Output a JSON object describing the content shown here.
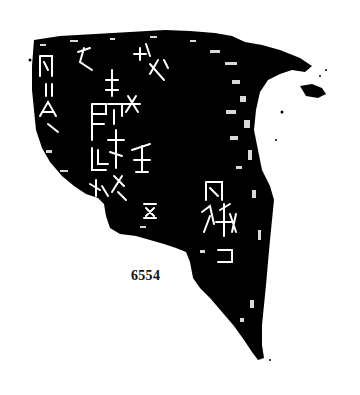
{
  "figure": {
    "type": "oracle-bone-rubbing",
    "catalog_number": "6554",
    "colors": {
      "background": "#ffffff",
      "ink": "#000000",
      "incision": "#ffffff",
      "label": "#111111"
    }
  }
}
